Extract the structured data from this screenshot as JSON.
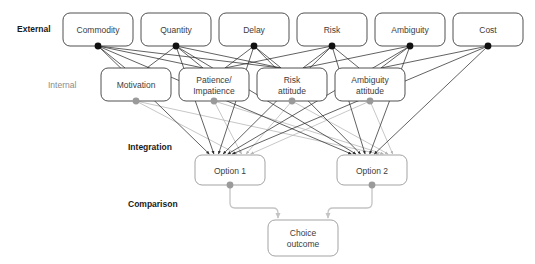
{
  "figure": {
    "background_color": "#ffffff"
  },
  "tiers": [
    {
      "id": "external",
      "label": "External",
      "style": "bold",
      "x": 17,
      "y": 32
    },
    {
      "id": "internal",
      "label": "Internal",
      "style": "light",
      "x": 48,
      "y": 88
    },
    {
      "id": "integration",
      "label": "Integration",
      "style": "bold",
      "x": 128,
      "y": 150
    },
    {
      "id": "comparison",
      "label": "Comparison",
      "style": "bold",
      "x": 128,
      "y": 207
    }
  ],
  "nodes": {
    "external": [
      {
        "id": "commodity",
        "label": "Commodity",
        "x": 63,
        "y": 13,
        "w": 70,
        "h": 33,
        "dot": "#111111"
      },
      {
        "id": "quantity",
        "label": "Quantity",
        "x": 141,
        "y": 13,
        "w": 70,
        "h": 33,
        "dot": "#111111"
      },
      {
        "id": "delay",
        "label": "Delay",
        "x": 219,
        "y": 13,
        "w": 70,
        "h": 33,
        "dot": "#111111"
      },
      {
        "id": "risk",
        "label": "Risk",
        "x": 297,
        "y": 13,
        "w": 70,
        "h": 33,
        "dot": "#111111"
      },
      {
        "id": "ambiguity",
        "label": "Ambiguity",
        "x": 375,
        "y": 13,
        "w": 70,
        "h": 33,
        "dot": "#111111"
      },
      {
        "id": "cost",
        "label": "Cost",
        "x": 453,
        "y": 13,
        "w": 70,
        "h": 33,
        "dot": "#111111"
      }
    ],
    "internal": [
      {
        "id": "motivation",
        "label_line1": "Motivation",
        "label_line2": "",
        "x": 101,
        "y": 68,
        "w": 70,
        "h": 33,
        "dot": "#9a9a9a"
      },
      {
        "id": "patience",
        "label_line1": "Patience/",
        "label_line2": "Impatience",
        "x": 179,
        "y": 68,
        "w": 70,
        "h": 33,
        "dot": "#9a9a9a"
      },
      {
        "id": "risk_attitude",
        "label_line1": "Risk",
        "label_line2": "attitude",
        "x": 257,
        "y": 68,
        "w": 70,
        "h": 33,
        "dot": "#9a9a9a"
      },
      {
        "id": "ambiguity_attitude",
        "label_line1": "Ambiguity",
        "label_line2": "attitude",
        "x": 335,
        "y": 68,
        "w": 70,
        "h": 33,
        "dot": "#9a9a9a"
      }
    ],
    "integration": [
      {
        "id": "option1",
        "label": "Option 1",
        "x": 195,
        "y": 155,
        "w": 70,
        "h": 30,
        "dot": "#9a9a9a"
      },
      {
        "id": "option2",
        "label": "Option 2",
        "x": 337,
        "y": 155,
        "w": 70,
        "h": 30,
        "dot": "#9a9a9a"
      }
    ],
    "comparison": [
      {
        "id": "choice_outcome",
        "label_line1": "Choice",
        "label_line2": "outcome",
        "x": 268,
        "y": 220,
        "w": 70,
        "h": 36
      }
    ]
  },
  "edges": {
    "external_to_internal_color": "#2e2e2e",
    "external_to_option_color": "#2e2e2e",
    "internal_to_option_color": "#b4b4b4",
    "option_to_choice_color": "#c4c4c4",
    "external_to_internal": [
      [
        "commodity",
        "motivation"
      ],
      [
        "commodity",
        "patience"
      ],
      [
        "commodity",
        "risk_attitude"
      ],
      [
        "quantity",
        "motivation"
      ],
      [
        "quantity",
        "patience"
      ],
      [
        "quantity",
        "risk_attitude"
      ],
      [
        "delay",
        "patience"
      ],
      [
        "delay",
        "risk_attitude"
      ],
      [
        "risk",
        "patience"
      ],
      [
        "risk",
        "risk_attitude"
      ],
      [
        "risk",
        "ambiguity_attitude"
      ],
      [
        "ambiguity",
        "risk_attitude"
      ],
      [
        "ambiguity",
        "ambiguity_attitude"
      ],
      [
        "cost",
        "ambiguity_attitude"
      ]
    ],
    "external_to_options": [
      [
        "commodity",
        "option1"
      ],
      [
        "commodity",
        "option2"
      ],
      [
        "quantity",
        "option1"
      ],
      [
        "quantity",
        "option2"
      ],
      [
        "delay",
        "option1"
      ],
      [
        "delay",
        "option2"
      ],
      [
        "risk",
        "option1"
      ],
      [
        "risk",
        "option2"
      ],
      [
        "ambiguity",
        "option1"
      ],
      [
        "ambiguity",
        "option2"
      ],
      [
        "cost",
        "option1"
      ],
      [
        "cost",
        "option2"
      ]
    ],
    "internal_to_options": [
      [
        "motivation",
        "option1"
      ],
      [
        "motivation",
        "option2"
      ],
      [
        "patience",
        "option1"
      ],
      [
        "patience",
        "option2"
      ],
      [
        "risk_attitude",
        "option1"
      ],
      [
        "risk_attitude",
        "option2"
      ],
      [
        "ambiguity_attitude",
        "option1"
      ],
      [
        "ambiguity_attitude",
        "option2"
      ]
    ],
    "options_to_choice": [
      [
        "option1",
        "choice_outcome"
      ],
      [
        "option2",
        "choice_outcome"
      ]
    ]
  }
}
